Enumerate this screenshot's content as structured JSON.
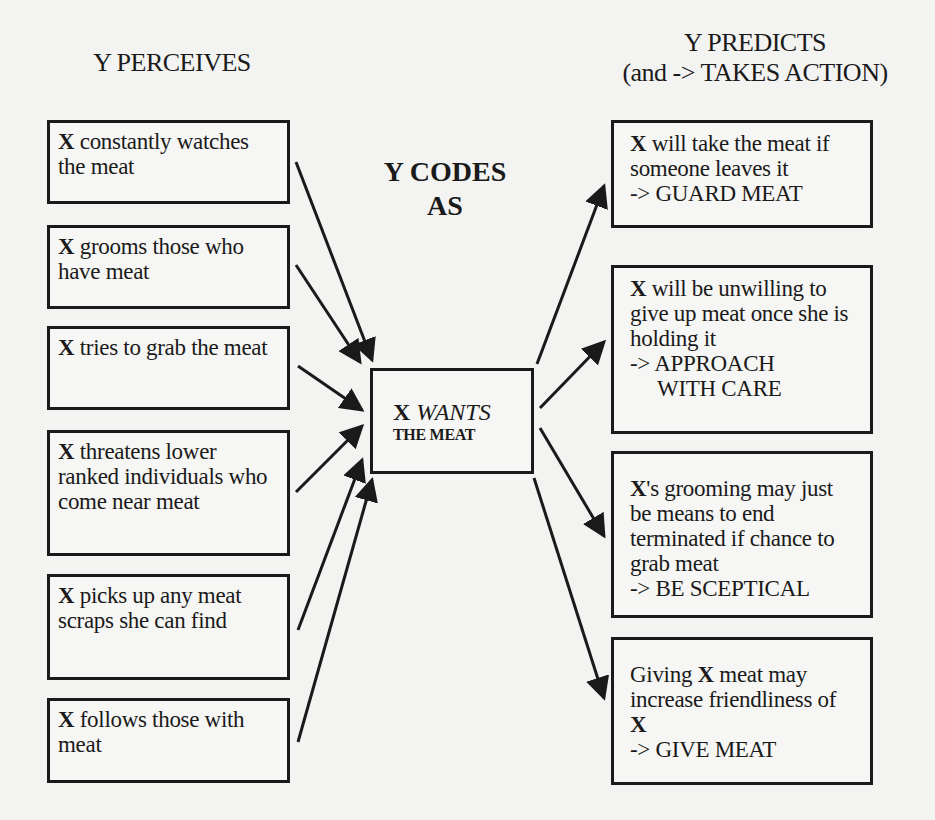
{
  "headers": {
    "perceives": "Y PERCEIVES",
    "predicts_line1": "Y PREDICTS",
    "predicts_line2": "(and -> TAKES ACTION)",
    "codes_line1": "Y CODES",
    "codes_line2": "AS"
  },
  "center": {
    "subject": "X",
    "verb": "WANTS",
    "object": "THE MEAT"
  },
  "perceptions": [
    {
      "subject": "X",
      "text": " constantly watches the meat"
    },
    {
      "subject": "X",
      "text": " grooms those who have meat"
    },
    {
      "subject": "X",
      "text": " tries to grab the meat"
    },
    {
      "subject": "X",
      "text": " threatens lower ranked individuals who come near meat"
    },
    {
      "subject": "X",
      "text": " picks up any meat scraps she can find"
    },
    {
      "subject": "X",
      "text": " follows those with meat"
    }
  ],
  "predictions": [
    {
      "subject": "X",
      "text": " will take the meat if someone leaves it",
      "action": "-> GUARD MEAT"
    },
    {
      "subject": "X",
      "text": " will be unwilling to give up meat once she is holding it",
      "action": "-> APPROACH",
      "action2": "WITH CARE"
    },
    {
      "subject": "X",
      "text": "'s grooming may just be means to end terminated if chance to grab meat",
      "action": "-> BE SCEPTICAL"
    },
    {
      "prefix": "Giving ",
      "subject": "X",
      "text": " meat may increase friendliness of ",
      "subject2": "X",
      "action": "-> GIVE MEAT"
    }
  ]
}
